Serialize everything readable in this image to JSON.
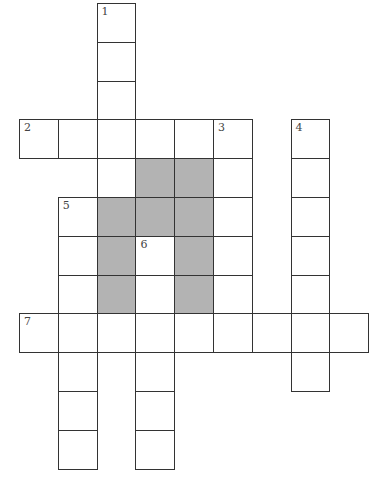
{
  "puzzle": {
    "cell_size": 38.8,
    "origin_x": 19,
    "origin_y": 3,
    "colors": {
      "line": "#333333",
      "fill": "#ffffff",
      "shaded": "#b3b3b3",
      "number": "#444444"
    },
    "clues": [
      {
        "number": "1",
        "direction": "down",
        "col": 2,
        "row": 0,
        "length": 5
      },
      {
        "number": "2",
        "direction": "across",
        "col": 0,
        "row": 3,
        "length": 6
      },
      {
        "number": "3",
        "direction": "down",
        "col": 5,
        "row": 3,
        "length": 6
      },
      {
        "number": "4",
        "direction": "down",
        "col": 7,
        "row": 3,
        "length": 7
      },
      {
        "number": "5",
        "direction": "down",
        "col": 1,
        "row": 5,
        "length": 7
      },
      {
        "number": "6",
        "direction": "down",
        "col": 3,
        "row": 6,
        "length": 6
      },
      {
        "number": "7",
        "direction": "across",
        "col": 0,
        "row": 8,
        "length": 9
      }
    ],
    "shaded_cells": [
      [
        2,
        5
      ],
      [
        2,
        6
      ],
      [
        2,
        7
      ],
      [
        3,
        4
      ],
      [
        3,
        5
      ],
      [
        4,
        4
      ],
      [
        4,
        5
      ],
      [
        4,
        6
      ],
      [
        4,
        7
      ]
    ]
  }
}
